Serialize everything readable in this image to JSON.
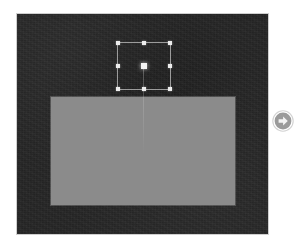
{
  "page": {
    "width": 296,
    "height": 248,
    "background_color": "#ffffff"
  },
  "top_strip": {
    "name": "cut-off-toolbar-remnant",
    "description": "Faint clipped bottom edge of a toolbar row above the visible area",
    "segments": [
      "",
      "",
      "",
      "",
      ""
    ]
  },
  "canvas": {
    "name": "slide-canvas",
    "background_color": "#262626",
    "border_color": "#cfcfcf",
    "bounds": {
      "x": 16,
      "y": 13,
      "width": 253,
      "height": 222
    }
  },
  "slide_shape": {
    "name": "gray-rectangle-shape",
    "fill_color": "#8b8b8b",
    "bounds": {
      "x": 50,
      "y": 96,
      "width": 184,
      "height": 108
    }
  },
  "alignment_guide": {
    "name": "vertical-center-guide",
    "color": "#ffffff",
    "x": 142,
    "y_start": 65,
    "y_end": 153
  },
  "selection": {
    "name": "selected-object",
    "outline_color": "#e4e4e4",
    "handle_color": "#ededed",
    "bounds": {
      "x": 116,
      "y": 41,
      "width": 54,
      "height": 48
    },
    "handles": [
      {
        "id": "nw",
        "label": "resize-handle-top-left"
      },
      {
        "id": "n",
        "label": "resize-handle-top-center"
      },
      {
        "id": "ne",
        "label": "resize-handle-top-right"
      },
      {
        "id": "w",
        "label": "resize-handle-middle-left"
      },
      {
        "id": "e",
        "label": "resize-handle-middle-right"
      },
      {
        "id": "sw",
        "label": "resize-handle-bottom-left"
      },
      {
        "id": "s",
        "label": "resize-handle-bottom-center"
      },
      {
        "id": "se",
        "label": "resize-handle-bottom-right"
      },
      {
        "id": "center",
        "label": "move-handle-center"
      }
    ]
  },
  "next_button": {
    "name": "next-arrow-button",
    "icon": "circle-arrow-right-icon",
    "circle_color": "#9a9a9a",
    "arrow_color": "#f2f2f2",
    "center": {
      "x": 283,
      "y": 121
    },
    "diameter": 22
  }
}
